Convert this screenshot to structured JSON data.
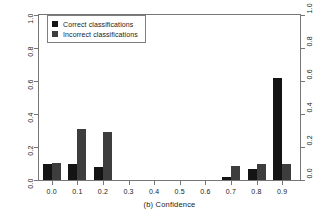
{
  "chart_data": {
    "type": "bar",
    "title": "",
    "subtitle": "",
    "xlabel": "(b) Confidence",
    "ylabel": "Relative frequency",
    "categories": [
      "0.0",
      "0.1",
      "0.2",
      "0.3",
      "0.4",
      "0.5",
      "0.6",
      "0.7",
      "0.8",
      "0.9"
    ],
    "series": [
      {
        "name": "Correct classifications",
        "color": "#141414",
        "values": [
          0.1,
          0.1,
          0.08,
          0.0,
          0.0,
          0.0,
          0.0,
          0.02,
          0.065,
          0.62
        ]
      },
      {
        "name": "Incorrect classifications",
        "color": "#3d3d3d",
        "values": [
          0.105,
          0.31,
          0.29,
          0.0,
          0.0,
          0.0,
          0.0,
          0.085,
          0.1,
          0.1
        ]
      }
    ],
    "xlim": [
      -0.05,
      0.97
    ],
    "ylim": [
      0.0,
      1.0
    ],
    "x_ticks": [
      "0.0",
      "0.1",
      "0.2",
      "0.3",
      "0.4",
      "0.5",
      "0.6",
      "0.7",
      "0.8",
      "0.9"
    ],
    "y_ticks": [
      "0.0",
      "0.2",
      "0.4",
      "0.6",
      "0.8",
      "1.0"
    ],
    "y_ticks_right": [
      "0.0",
      "0.2",
      "0.4",
      "0.6",
      "0.8",
      "1.0"
    ],
    "grid": false,
    "frame": true,
    "legend_position": "top-left",
    "legend": [
      {
        "label": "Correct classifications",
        "color": "#141414"
      },
      {
        "label": "Incorrect classifications",
        "color": "#3d3d3d"
      }
    ]
  },
  "axes": {
    "y_title": "Relative frequency",
    "x_title": "(b) Confidence"
  }
}
